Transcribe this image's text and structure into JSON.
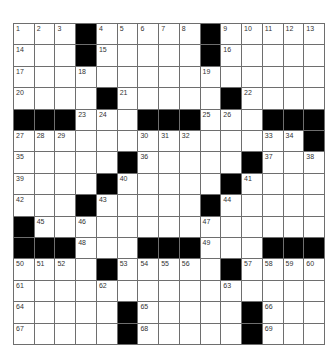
{
  "puzzle": {
    "rows": 15,
    "cols": 15,
    "colors": {
      "black": "#000000",
      "white": "#ffffff",
      "grid_line": "#6e6e6e",
      "number": "#333333"
    },
    "grid": [
      [
        "1",
        "2",
        "3",
        "#",
        "4",
        "5",
        "6",
        "7",
        "8",
        "#",
        "9",
        "10",
        "11",
        "12",
        "13"
      ],
      [
        "14",
        "",
        "",
        "#",
        "15",
        "",
        "",
        "",
        "",
        "#",
        "16",
        "",
        "",
        "",
        ""
      ],
      [
        "17",
        "",
        "",
        "18",
        "",
        "",
        "",
        "",
        "",
        "19",
        "",
        "",
        "",
        "",
        ""
      ],
      [
        "20",
        "",
        "",
        "",
        "#",
        "21",
        "",
        "",
        "",
        "",
        "#",
        "22",
        "",
        "",
        ""
      ],
      [
        "#",
        "#",
        "#",
        "23",
        "24",
        "",
        "#",
        "#",
        "#",
        "25",
        "26",
        "",
        "#",
        "#",
        "#"
      ],
      [
        "27",
        "28",
        "29",
        "",
        "",
        "",
        "30",
        "31",
        "32",
        "",
        "",
        "",
        "33",
        "34",
        "#"
      ],
      [
        "35",
        "",
        "",
        "",
        "",
        "#",
        "36",
        "",
        "",
        "",
        "",
        "#",
        "37",
        "",
        "38"
      ],
      [
        "39",
        "",
        "",
        "",
        "#",
        "40",
        "",
        "",
        "",
        "",
        "#",
        "41",
        "",
        "",
        ""
      ],
      [
        "42",
        "",
        "",
        "#",
        "43",
        "",
        "",
        "",
        "",
        "#",
        "44",
        "",
        "",
        "",
        ""
      ],
      [
        "#",
        "45",
        "",
        "46",
        "",
        "",
        "",
        "",
        "",
        "47",
        "",
        "",
        "",
        "",
        ""
      ],
      [
        "#",
        "#",
        "#",
        "48",
        "",
        "",
        "#",
        "#",
        "#",
        "49",
        "",
        "",
        "#",
        "#",
        "#"
      ],
      [
        "50",
        "51",
        "52",
        "",
        "#",
        "53",
        "54",
        "55",
        "56",
        "",
        "#",
        "57",
        "58",
        "59",
        "60"
      ],
      [
        "61",
        "",
        "",
        "",
        "62",
        "",
        "",
        "",
        "",
        "",
        "63",
        "",
        "",
        "",
        ""
      ],
      [
        "64",
        "",
        "",
        "",
        "",
        "#",
        "65",
        "",
        "",
        "",
        "",
        "#",
        "66",
        "",
        ""
      ],
      [
        "67",
        "",
        "",
        "",
        "",
        "#",
        "68",
        "",
        "",
        "",
        "",
        "#",
        "69",
        "",
        ""
      ]
    ]
  }
}
